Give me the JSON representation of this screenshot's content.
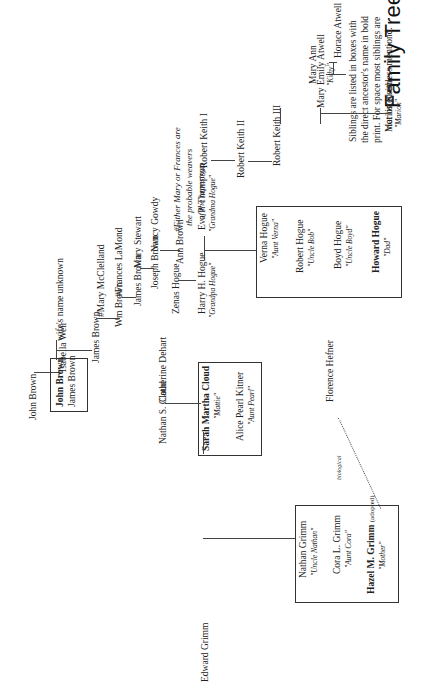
{
  "title": "Family Tree",
  "intro": [
    "Siblings are listed in boxes with",
    "the direct ancestor's name in bold",
    "print.  For space most siblings are",
    "not listed unless mentiond."
  ],
  "note": [
    "#Either Mary or Frances are",
    "the probable weavers",
    "of the tapestry."
  ],
  "people": {
    "horace_atwell": "Horace Atwell",
    "mary_ann": "Mary Ann",
    "mary_emily_atwell": "Mary Emily Atwell",
    "mary_emily_nick": "\"Kithy\"",
    "marion_keith": "Marion Keith",
    "marion_nick": "\"Marion\"",
    "robert_keith_1": "Robert Keith I",
    "robert_keith_2": "Robert Keith II",
    "robert_keith_3": "Robert Keith III",
    "john_brown_sr": "John Brown",
    "isabella_weir": "Isabella Weir",
    "wife_unknown": "wife's name unknown",
    "james_brown_1": "James Brown",
    "mary_mcclelland": "#Mary McClelland",
    "wm_brown": "Wm Brown",
    "frances_lamond": "#Frances LaMond",
    "james_brown_2": "James Brown",
    "mary_stewart": "Mary Stewart",
    "joseph_brown": "Joseph Brown",
    "nancy_gowdy": "Nancy Gowdy",
    "zenas_hogue": "Zenas Hogue",
    "ann_brown": "Ann Brown",
    "harry_hogue": "Harry H. Hogue",
    "harry_nick": "\"Grandpa Hogue\"",
    "eva_thompson": "Eva P. Thompson",
    "eva_nick": "\"Grandma Hogue\"",
    "nathan_cloud": "Nathan S. Cloud",
    "catherine_dehart": "Catherine Dehart",
    "edward_grimm": "Edward Grimm",
    "florence_hefner": "Florence Hefner",
    "biological": "biological"
  },
  "boxes": {
    "brown": {
      "bold": "John Brown",
      "other": "James Brown"
    },
    "cloud": {
      "bold": "Sarah Martha Cloud",
      "bold_nick": "\"Mattie\"",
      "other": "Alice Pearl Kitner",
      "other_nick": "\"Aunt Pearl\""
    },
    "hogue": [
      {
        "name": "Verna Hogue",
        "nick": "\"Aunt Verna\""
      },
      {
        "name": "Robert Hogue",
        "nick": "\"Uncle Bob\""
      },
      {
        "name": "Boyd Hogue",
        "nick": "\"Uncle Boyd\""
      },
      {
        "name": "Howard Hogue",
        "nick": "\"Dad\"",
        "bold": true
      }
    ],
    "grimm": [
      {
        "name": "Nathan Grimm",
        "nick": "\"Uncle Nathan\""
      },
      {
        "name": "Cora L. Grimm",
        "nick": "\"Aunt Cora\""
      },
      {
        "name": "Hazel M. Grimm",
        "suffix": "(adopted)",
        "nick": "\"Mother\"",
        "bold": true
      }
    ]
  }
}
